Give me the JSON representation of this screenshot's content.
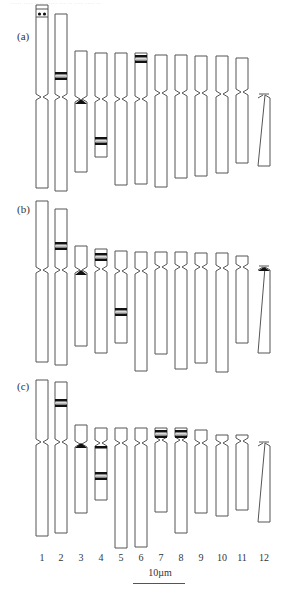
{
  "header": {
    "text": "·····  ···· ···· ····· ··· ·· ···· ···· ··"
  },
  "panels": [
    {
      "label": "(a)",
      "chromosomes": [
        {
          "n": 1,
          "top": 5,
          "cen": 97,
          "bottom": 188,
          "satellite": true,
          "dots": true,
          "bands": []
        },
        {
          "n": 2,
          "top": 14,
          "cen": 97,
          "bottom": 191,
          "bands": [
            {
              "pos": 72,
              "type": "pair"
            }
          ]
        },
        {
          "n": 3,
          "top": 51,
          "cen": 99,
          "bottom": 172,
          "bands": [
            {
              "pos": 101,
              "type": "cen-block"
            }
          ]
        },
        {
          "n": 4,
          "top": 53,
          "cen": 99,
          "bottom": 157,
          "bands": [
            {
              "pos": 137,
              "type": "pair"
            }
          ]
        },
        {
          "n": 5,
          "top": 53,
          "cen": 99,
          "bottom": 185,
          "bands": []
        },
        {
          "n": 6,
          "top": 53,
          "cen": 99,
          "bottom": 184,
          "bands": [
            {
              "pos": 55,
              "type": "pair"
            }
          ]
        },
        {
          "n": 7,
          "top": 55,
          "cen": 93,
          "bottom": 187,
          "bands": []
        },
        {
          "n": 8,
          "top": 55,
          "cen": 93,
          "bottom": 178,
          "bands": []
        },
        {
          "n": 9,
          "top": 56,
          "cen": 93,
          "bottom": 176,
          "bands": []
        },
        {
          "n": 10,
          "top": 56,
          "cen": 94,
          "bottom": 173,
          "bands": []
        },
        {
          "n": 11,
          "top": 58,
          "cen": 92,
          "bottom": 163,
          "bands": []
        },
        {
          "n": 12,
          "top": 0,
          "cen": 96,
          "bottom": 166,
          "acro": true,
          "bands": []
        }
      ]
    },
    {
      "label": "(b)",
      "chromosomes": [
        {
          "n": 1,
          "top": 201,
          "cen": 270,
          "bottom": 362,
          "bands": []
        },
        {
          "n": 2,
          "top": 209,
          "cen": 270,
          "bottom": 365,
          "bands": [
            {
              "pos": 242,
              "type": "pair"
            }
          ]
        },
        {
          "n": 3,
          "top": 246,
          "cen": 270,
          "bottom": 346,
          "bands": [
            {
              "pos": 272,
              "type": "cen-block"
            }
          ]
        },
        {
          "n": 4,
          "top": 249,
          "cen": 269,
          "bottom": 353,
          "bands": [
            {
              "pos": 253,
              "type": "pair"
            }
          ]
        },
        {
          "n": 5,
          "top": 251,
          "cen": 271,
          "bottom": 343,
          "bands": [
            {
              "pos": 308,
              "type": "pair"
            }
          ]
        },
        {
          "n": 6,
          "top": 252,
          "cen": 271,
          "bottom": 371,
          "bands": []
        },
        {
          "n": 7,
          "top": 252,
          "cen": 267,
          "bottom": 354,
          "bands": []
        },
        {
          "n": 8,
          "top": 252,
          "cen": 267,
          "bottom": 369,
          "bands": []
        },
        {
          "n": 9,
          "top": 253,
          "cen": 267,
          "bottom": 363,
          "bands": []
        },
        {
          "n": 10,
          "top": 253,
          "cen": 268,
          "bottom": 372,
          "bands": []
        },
        {
          "n": 11,
          "top": 256,
          "cen": 267,
          "bottom": 343,
          "bands": []
        },
        {
          "n": 12,
          "top": 0,
          "cen": 268,
          "bottom": 353,
          "acro": true,
          "acroBlock": true,
          "bands": []
        }
      ]
    },
    {
      "label": "(c)",
      "chromosomes": [
        {
          "n": 1,
          "top": 380,
          "cen": 442,
          "bottom": 536,
          "bands": []
        },
        {
          "n": 2,
          "top": 382,
          "cen": 442,
          "bottom": 533,
          "bands": [
            {
              "pos": 399,
              "type": "pair"
            }
          ]
        },
        {
          "n": 3,
          "top": 425,
          "cen": 444,
          "bottom": 513,
          "bands": [
            {
              "pos": 445,
              "type": "cen-block"
            }
          ]
        },
        {
          "n": 4,
          "top": 428,
          "cen": 443,
          "bottom": 500,
          "bands": [
            {
              "pos": 446,
              "type": "single"
            },
            {
              "pos": 472,
              "type": "pair"
            }
          ]
        },
        {
          "n": 5,
          "top": 428,
          "cen": 443,
          "bottom": 548,
          "bands": []
        },
        {
          "n": 6,
          "top": 428,
          "cen": 443,
          "bottom": 547,
          "bands": []
        },
        {
          "n": 7,
          "top": 428,
          "cen": 440,
          "bottom": 512,
          "bands": [
            {
              "pos": 430,
              "type": "pair"
            }
          ]
        },
        {
          "n": 8,
          "top": 428,
          "cen": 440,
          "bottom": 533,
          "bands": [
            {
              "pos": 430,
              "type": "pair"
            }
          ]
        },
        {
          "n": 9,
          "top": 430,
          "cen": 443,
          "bottom": 513,
          "bands": []
        },
        {
          "n": 10,
          "top": 435,
          "cen": 443,
          "bottom": 516,
          "bands": []
        },
        {
          "n": 11,
          "top": 435,
          "cen": 441,
          "bottom": 510,
          "bands": []
        },
        {
          "n": 12,
          "top": 0,
          "cen": 444,
          "bottom": 522,
          "acro": true,
          "bands": []
        }
      ]
    }
  ],
  "chromosome_numbers": [
    "1",
    "2",
    "3",
    "4",
    "5",
    "6",
    "7",
    "8",
    "9",
    "10",
    "11",
    "12"
  ],
  "scale": {
    "label": "10µm",
    "value_um": 10
  }
}
